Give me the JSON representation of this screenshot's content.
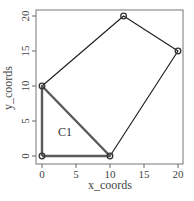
{
  "chart_data": {
    "type": "line",
    "title": "",
    "xlabel": "x_coords",
    "ylabel": "y_coords",
    "xlim": [
      0,
      20
    ],
    "ylim": [
      0,
      20
    ],
    "xticks": [
      0,
      5,
      10,
      15,
      20
    ],
    "yticks": [
      0,
      5,
      10,
      15,
      20
    ],
    "grid": false,
    "legend": null,
    "series": [
      {
        "name": "hull",
        "style": "thin black line with circle markers",
        "points": [
          [
            0,
            10
          ],
          [
            12,
            20
          ],
          [
            20,
            15
          ],
          [
            10,
            0
          ]
        ]
      },
      {
        "name": "C1",
        "style": "thick gray closed polygon with circle markers",
        "points": [
          [
            0,
            0
          ],
          [
            0,
            10
          ],
          [
            10,
            0
          ],
          [
            0,
            0
          ]
        ]
      }
    ],
    "annotations": [
      {
        "text": "C1",
        "x": 3.4,
        "y": 3.5
      }
    ]
  },
  "colors": {
    "hull_line": "#222222",
    "c1_line": "#5a5a5a",
    "marker": "#333333",
    "axis": "#666666",
    "text": "#444444"
  }
}
